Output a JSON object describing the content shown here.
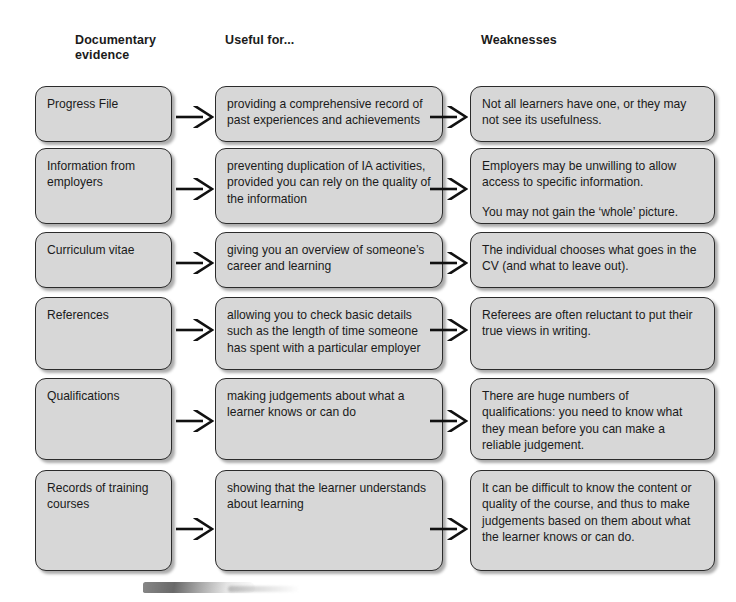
{
  "headers": [
    {
      "line1": "Documentary",
      "line2": "evidence"
    },
    {
      "line1": "Useful for...",
      "line2": ""
    },
    {
      "line1": "Weaknesses",
      "line2": ""
    }
  ],
  "rows": [
    {
      "evidence": "Progress File",
      "useful_for": [
        "providing a comprehensive record of past experiences and achievements"
      ],
      "weaknesses": [
        "Not all learners have one, or they may not see its usefulness."
      ]
    },
    {
      "evidence": "Information from employers",
      "useful_for": [
        "preventing duplication of IA activities, provided you can rely on the quality of the information"
      ],
      "weaknesses": [
        "Employers may be unwilling to allow access to specific information.",
        "You may not gain the ‘whole’ picture."
      ]
    },
    {
      "evidence": "Curriculum vitae",
      "useful_for": [
        "giving you an overview of someone’s career and learning"
      ],
      "weaknesses": [
        "The individual chooses what goes in the CV (and what to leave out)."
      ]
    },
    {
      "evidence": "References",
      "useful_for": [
        "allowing you to check basic details such as the length of time someone has spent with a particular employer"
      ],
      "weaknesses": [
        "Referees are often reluctant to put their true views in writing."
      ]
    },
    {
      "evidence": "Qualifications",
      "useful_for": [
        "making judgements about what a learner knows or can do"
      ],
      "weaknesses": [
        "There are huge numbers of qualifications: you need to know what they mean before you can make a reliable judgement."
      ]
    },
    {
      "evidence": "Records of training courses",
      "useful_for": [
        "showing that the learner understands about learning"
      ],
      "weaknesses": [
        "It can be difficult to know the content or quality of the course, and thus to make judgements based on them about what the learner knows or can do."
      ]
    }
  ],
  "colors": {
    "box_fill": "#d7d7d7",
    "box_border": "#2b2b2b",
    "text": "#1a1a1a",
    "arrow": "#111111",
    "page_background": "#ffffff"
  },
  "layout": {
    "columns": [
      {
        "left": 35,
        "width": 137
      },
      {
        "left": 215,
        "width": 228
      },
      {
        "left": 470,
        "width": 245
      }
    ],
    "row_geometry": [
      {
        "top": 86,
        "height": 56,
        "arrow_y": 106
      },
      {
        "top": 148,
        "height": 76,
        "arrow_y": 178
      },
      {
        "top": 232,
        "height": 56,
        "arrow_y": 252
      },
      {
        "top": 297,
        "height": 73,
        "arrow_y": 319
      },
      {
        "top": 378,
        "height": 82,
        "arrow_y": 410
      },
      {
        "top": 470,
        "height": 101,
        "arrow_y": 518
      }
    ],
    "arrow_x": [
      176,
      430
    ]
  }
}
